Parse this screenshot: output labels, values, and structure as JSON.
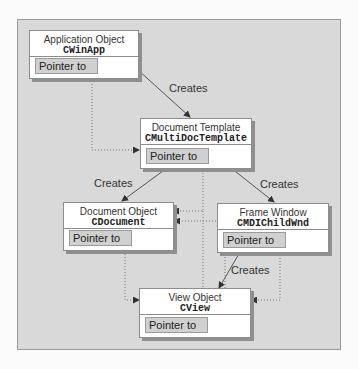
{
  "diagram": {
    "nodes": [
      {
        "id": "app",
        "title": "Application Object",
        "class": "CWinApp",
        "pointer_label": "Pointer to"
      },
      {
        "id": "template",
        "title": "Document Template",
        "class": "CMultiDocTemplate",
        "pointer_label": "Pointer to"
      },
      {
        "id": "document",
        "title": "Document Object",
        "class": "CDocument",
        "pointer_label": "Pointer to"
      },
      {
        "id": "frame",
        "title": "Frame Window",
        "class": "CMDIChildWnd",
        "pointer_label": "Pointer to"
      },
      {
        "id": "view",
        "title": "View Object",
        "class": "CView",
        "pointer_label": "Pointer to"
      }
    ],
    "edge_labels": {
      "app_creates_template": "Creates",
      "template_creates_document": "Creates",
      "template_creates_frame": "Creates",
      "frame_creates_view": "Creates"
    },
    "colors": {
      "panel": "#d9d9d9",
      "box": "#ffffff",
      "pointer_cell": "#d0d0d0",
      "line": "#555555"
    }
  }
}
